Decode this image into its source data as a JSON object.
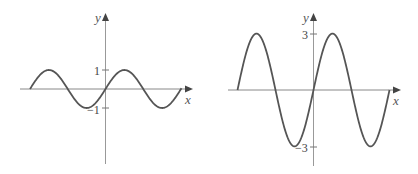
{
  "chart_data": [
    {
      "type": "line",
      "title": "",
      "xlabel": "x",
      "ylabel": "y",
      "function": "y = sin(x)",
      "amplitude": 1,
      "y_ticks": [
        {
          "value": 1,
          "label": "1"
        },
        {
          "value": -1,
          "label": "−1"
        }
      ],
      "x_range_periods": [
        -2,
        2
      ],
      "ylim": [
        -3,
        3
      ],
      "grid": false,
      "series": [
        {
          "name": "sine",
          "color": "#555555"
        }
      ]
    },
    {
      "type": "line",
      "title": "",
      "xlabel": "x",
      "ylabel": "y",
      "function": "y = 3 sin(x)",
      "amplitude": 3,
      "y_ticks": [
        {
          "value": 3,
          "label": "3"
        },
        {
          "value": -3,
          "label": "−3"
        }
      ],
      "x_range_periods": [
        -2,
        2
      ],
      "ylim": [
        -3,
        3
      ],
      "grid": false,
      "series": [
        {
          "name": "sine",
          "color": "#555555"
        }
      ]
    }
  ],
  "charts": {
    "left": {
      "x_label": "x",
      "y_label": "y",
      "tick_pos": "1",
      "tick_neg": "−1"
    },
    "right": {
      "x_label": "x",
      "y_label": "y",
      "tick_pos": "3",
      "tick_neg": "−3"
    }
  }
}
